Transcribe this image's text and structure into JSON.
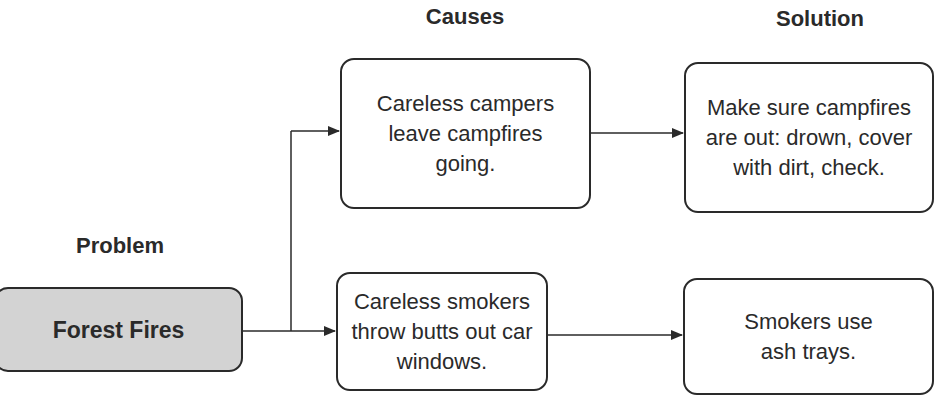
{
  "headings": {
    "problem": "Problem",
    "causes": "Causes",
    "solution": "Solution"
  },
  "problem": {
    "label": "Forest Fires",
    "fill": "#d3d3d3"
  },
  "causes": [
    {
      "label": "Careless campers leave campfires going."
    },
    {
      "label": "Careless smokers throw butts out car windows."
    }
  ],
  "solutions": [
    {
      "label": "Make sure campfires are out: drown, cover with dirt, check."
    },
    {
      "label": "Smokers use ash trays."
    }
  ],
  "edges": [
    {
      "from": "Forest Fires",
      "to": "Careless campers leave campfires going."
    },
    {
      "from": "Forest Fires",
      "to": "Careless smokers throw butts out car windows."
    },
    {
      "from": "Careless campers leave campfires going.",
      "to": "Make sure campfires are out: drown, cover with dirt, check."
    },
    {
      "from": "Careless smokers throw butts out car windows.",
      "to": "Smokers use ash trays."
    }
  ]
}
